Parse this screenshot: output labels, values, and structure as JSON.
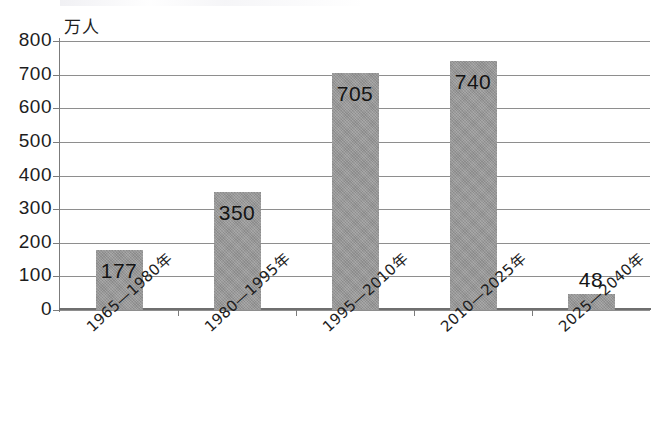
{
  "chart_data": {
    "type": "bar",
    "title": "",
    "subtitle": "",
    "unit_label": "万人",
    "xlabel": "",
    "ylabel": "",
    "ylim": [
      0,
      800
    ],
    "ytick_step": 100,
    "grid": true,
    "legend": "none",
    "bar_color": "#969696",
    "categories": [
      "1965—1980年",
      "1980—1995年",
      "1995—2010年",
      "2010—2025年",
      "2025—2040年"
    ],
    "values": [
      177,
      350,
      705,
      740,
      48
    ],
    "value_labels": [
      "177",
      "350",
      "705",
      "740",
      "48"
    ],
    "yticks": [
      "800",
      "700",
      "600",
      "500",
      "400",
      "300",
      "200",
      "100",
      "0"
    ]
  }
}
